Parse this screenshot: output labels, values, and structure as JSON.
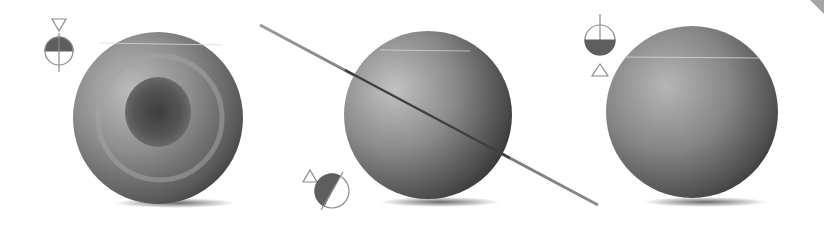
{
  "figure": {
    "colors": {
      "background": "#ffffff",
      "sphere_light": "#b4b4b4",
      "sphere_mid": "#7c7c7c",
      "sphere_dark": "#3a3a3a",
      "diagram_fill": "#5f5f5f",
      "diagram_stroke": "#888888"
    },
    "spheres": [
      {
        "id": "left",
        "cx": 158,
        "cy": 118,
        "r": 85,
        "style": "concentric-rings",
        "indicator": "triangle-down-above"
      },
      {
        "id": "middle",
        "cx": 428,
        "cy": 115,
        "r": 84,
        "style": "ringed-tilted",
        "indicator": "triangle-up-left-tilted"
      },
      {
        "id": "right",
        "cx": 692,
        "cy": 112,
        "r": 85,
        "style": "plain",
        "indicator": "triangle-up-below"
      }
    ],
    "ring": {
      "x1": 260,
      "y1": 25,
      "x2": 598,
      "y2": 205
    }
  }
}
